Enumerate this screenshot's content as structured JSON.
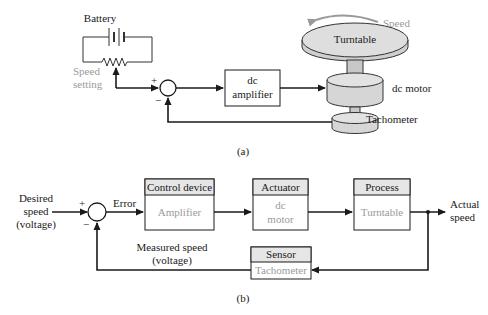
{
  "figure_a": {
    "caption": "(a)",
    "battery_label": "Battery",
    "speed_setting_line1": "Speed",
    "speed_setting_line2": "setting",
    "plus_sign": "+",
    "minus_sign": "−",
    "amplifier_line1": "dc",
    "amplifier_line2": "amplifier",
    "turntable_label": "Turntable",
    "speed_label": "Speed",
    "motor_label": "dc motor",
    "tachometer_label": "Tachometer"
  },
  "figure_b": {
    "caption": "(b)",
    "input_line1": "Desired",
    "input_line2": "speed",
    "input_line3": "(voltage)",
    "plus_sign": "+",
    "minus_sign": "−",
    "error_label": "Error",
    "blocks": [
      {
        "header": "Control device",
        "body_line1": "Amplifier",
        "body_line2": ""
      },
      {
        "header": "Actuator",
        "body_line1": "dc",
        "body_line2": "motor"
      },
      {
        "header": "Process",
        "body_line1": "Turntable",
        "body_line2": ""
      }
    ],
    "sensor": {
      "header": "Sensor",
      "body": "Tachometer"
    },
    "output_line1": "Actual",
    "output_line2": "speed",
    "feedback_line1": "Measured speed",
    "feedback_line2": "(voltage)"
  },
  "colors": {
    "line": "#1a1a1a",
    "gray_text": "#9a9a9a",
    "header_fill": "#e6e6e6",
    "cylinder_fill": "#d9d9d9"
  }
}
